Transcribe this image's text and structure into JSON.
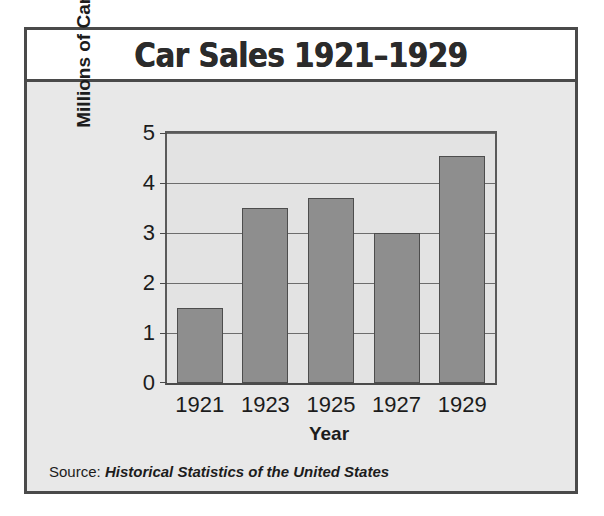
{
  "figure": {
    "title": "Car Sales 1921–1929",
    "source_prefix": "Source: ",
    "source_reference": "Historical Statistics of the United States"
  },
  "chart_data": {
    "type": "bar",
    "title": "Car Sales 1921–1929",
    "categories": [
      "1921",
      "1923",
      "1925",
      "1927",
      "1929"
    ],
    "values": [
      1.5,
      3.5,
      3.7,
      3.0,
      4.55
    ],
    "xlabel": "Year",
    "ylabel": "Millions of Cars",
    "ylim": [
      0,
      5
    ],
    "yticks": [
      0,
      1,
      2,
      3,
      4,
      5
    ],
    "ytick_labels": [
      "0",
      "1",
      "2",
      "3",
      "4",
      "5"
    ],
    "grid": true,
    "legend": false,
    "bar_color": "#8e8e8e",
    "bar_edge_color": "#4d4d4d",
    "plot_background": "#e3e3e3",
    "figure_background": "#e8e8e8",
    "title_background": "#ffffff",
    "frame_color": "#4a4a4a",
    "source": "Source: Historical Statistics of the United States"
  }
}
